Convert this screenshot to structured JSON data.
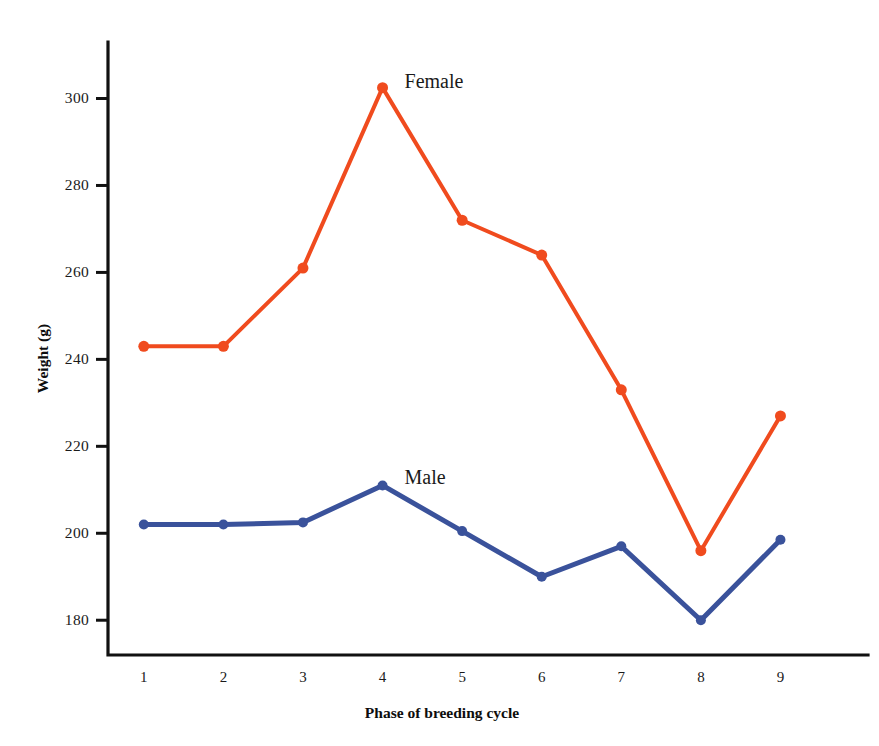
{
  "chart_data": {
    "type": "line",
    "title": "",
    "xlabel": "Phase of breeding cycle",
    "ylabel": "Weight (g)",
    "x": [
      1,
      2,
      3,
      4,
      5,
      6,
      7,
      8,
      9
    ],
    "categories": [
      "1",
      "2",
      "3",
      "4",
      "5",
      "6",
      "7",
      "8",
      "9"
    ],
    "xtick_labels": [
      "1",
      "2",
      "3",
      "4",
      "5",
      "6",
      "7",
      "8",
      "9"
    ],
    "ytick_labels": [
      "300",
      "280",
      "260",
      "240",
      "220",
      "200",
      "180"
    ],
    "ytick_values": [
      300,
      280,
      260,
      240,
      220,
      200,
      180
    ],
    "ylim": [
      172,
      313
    ],
    "xlim": [
      0.55,
      10.1
    ],
    "grid": false,
    "legend_position": "inline-annotation",
    "series": [
      {
        "name": "Female",
        "color": "#f04b1e",
        "marker": "circle",
        "marker_size": 11,
        "line_width": 4,
        "label_point_index": 3,
        "label_offset": [
          22,
          -4
        ],
        "values": [
          243,
          243,
          261,
          302.5,
          272,
          264,
          233,
          196,
          227
        ]
      },
      {
        "name": "Male",
        "color": "#3a529b",
        "marker": "circle",
        "marker_size": 10,
        "line_width": 5,
        "label_point_index": 3,
        "label_offset": [
          22,
          -6
        ],
        "values": [
          202,
          202,
          202.5,
          211,
          200.5,
          190,
          197,
          180,
          198.5
        ]
      }
    ]
  },
  "colors": {
    "female": "#f04b1e",
    "male": "#3a529b",
    "axis": "#111111",
    "background": "#ffffff",
    "text": "#1a1a1a"
  },
  "layout": {
    "plot_left": 108,
    "plot_right": 868,
    "plot_top": 42,
    "plot_bottom": 655,
    "y_axis_top": 42,
    "tick_length": 12
  }
}
